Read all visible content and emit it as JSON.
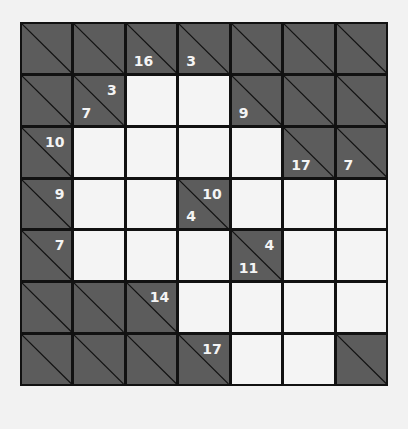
{
  "puzzle": {
    "type": "kakuro",
    "rows": 7,
    "cols": 7,
    "colors": {
      "clue_cell": "#5c5c5c",
      "white_cell": "#f4f4f4",
      "grid_line": "#111111",
      "clue_text": "#f4f4f4"
    },
    "grid": [
      [
        {
          "type": "clue"
        },
        {
          "type": "clue"
        },
        {
          "type": "clue",
          "down": "16"
        },
        {
          "type": "clue",
          "down": "3"
        },
        {
          "type": "clue"
        },
        {
          "type": "clue"
        },
        {
          "type": "clue"
        }
      ],
      [
        {
          "type": "clue"
        },
        {
          "type": "clue",
          "across": "3",
          "down": "7"
        },
        {
          "type": "white",
          "value": ""
        },
        {
          "type": "white",
          "value": ""
        },
        {
          "type": "clue",
          "down": "9"
        },
        {
          "type": "clue"
        },
        {
          "type": "clue"
        }
      ],
      [
        {
          "type": "clue",
          "across": "10"
        },
        {
          "type": "white",
          "value": ""
        },
        {
          "type": "white",
          "value": ""
        },
        {
          "type": "white",
          "value": ""
        },
        {
          "type": "white",
          "value": ""
        },
        {
          "type": "clue",
          "down": "17"
        },
        {
          "type": "clue",
          "down": "7"
        }
      ],
      [
        {
          "type": "clue",
          "across": "9"
        },
        {
          "type": "white",
          "value": ""
        },
        {
          "type": "white",
          "value": ""
        },
        {
          "type": "clue",
          "across": "10",
          "down": "4"
        },
        {
          "type": "white",
          "value": ""
        },
        {
          "type": "white",
          "value": ""
        },
        {
          "type": "white",
          "value": ""
        }
      ],
      [
        {
          "type": "clue",
          "across": "7"
        },
        {
          "type": "white",
          "value": ""
        },
        {
          "type": "white",
          "value": ""
        },
        {
          "type": "white",
          "value": ""
        },
        {
          "type": "clue",
          "across": "4",
          "down": "11"
        },
        {
          "type": "white",
          "value": ""
        },
        {
          "type": "white",
          "value": ""
        }
      ],
      [
        {
          "type": "clue"
        },
        {
          "type": "clue"
        },
        {
          "type": "clue",
          "across": "14"
        },
        {
          "type": "white",
          "value": ""
        },
        {
          "type": "white",
          "value": ""
        },
        {
          "type": "white",
          "value": ""
        },
        {
          "type": "white",
          "value": ""
        }
      ],
      [
        {
          "type": "clue"
        },
        {
          "type": "clue"
        },
        {
          "type": "clue"
        },
        {
          "type": "clue",
          "across": "17"
        },
        {
          "type": "white",
          "value": ""
        },
        {
          "type": "white",
          "value": ""
        },
        {
          "type": "clue"
        }
      ]
    ]
  }
}
